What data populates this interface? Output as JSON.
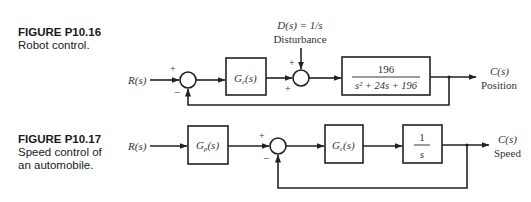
{
  "figures": [
    {
      "id": "P10.16",
      "title": "FIGURE P10.16",
      "caption_lines": [
        "Robot control."
      ],
      "input": "R(s)",
      "blocks": [
        {
          "name": "controller",
          "label": "G",
          "sub": "c",
          "arg": "(s)"
        },
        {
          "name": "plant",
          "numerator": "196",
          "denominator": "s² + 24s + 196"
        }
      ],
      "disturbance": {
        "label": "D(s) = 1/s",
        "caption": "Disturbance"
      },
      "junction1_signs": {
        "top": "+",
        "bottom": "−"
      },
      "junction2_signs": {
        "top": "+",
        "bottom": "+"
      },
      "output": {
        "label": "C(s)",
        "caption": "Position"
      }
    },
    {
      "id": "P10.17",
      "title": "FIGURE P10.17",
      "caption_lines": [
        "Speed control of",
        "an automobile."
      ],
      "input": "R(s)",
      "blocks": [
        {
          "name": "prefilter",
          "label": "G",
          "sub": "p",
          "arg": "(s)"
        },
        {
          "name": "controller",
          "label": "G",
          "sub": "c",
          "arg": "(s)"
        },
        {
          "name": "integrator",
          "numerator": "1",
          "denominator": "s"
        }
      ],
      "junction_signs": {
        "top": "+",
        "bottom": "−"
      },
      "output": {
        "label": "C(s)",
        "caption": "Speed"
      }
    }
  ]
}
